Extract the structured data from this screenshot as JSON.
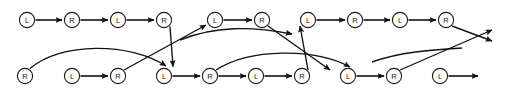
{
  "diagram": {
    "type": "directed-graph",
    "width": 506,
    "height": 95,
    "background_color": "#ffffff",
    "node_stroke_color": "#1a1a1a",
    "node_fill_color": "#ffffff",
    "edge_color": "#111111",
    "node_radius": 7.5,
    "rows": [
      {
        "name": "top-row",
        "y": 20,
        "nodes": [
          {
            "id": "t1",
            "label": "L",
            "x": 27
          },
          {
            "id": "t2",
            "label": "R",
            "x": 72
          },
          {
            "id": "t3",
            "label": "L",
            "x": 118
          },
          {
            "id": "t4",
            "label": "R",
            "x": 164
          },
          {
            "id": "t5",
            "label": "L",
            "x": 215
          },
          {
            "id": "t6",
            "label": "R",
            "x": 262
          },
          {
            "id": "t7",
            "label": "L",
            "x": 308
          },
          {
            "id": "t8",
            "label": "R",
            "x": 355
          },
          {
            "id": "t9",
            "label": "L",
            "x": 400
          },
          {
            "id": "t10",
            "label": "R",
            "x": 446
          }
        ]
      },
      {
        "name": "bottom-row",
        "y": 76,
        "nodes": [
          {
            "id": "b1",
            "label": "R",
            "x": 25
          },
          {
            "id": "b2",
            "label": "L",
            "x": 72
          },
          {
            "id": "b3",
            "label": "R",
            "x": 118
          },
          {
            "id": "b4",
            "label": "L",
            "x": 164
          },
          {
            "id": "b5",
            "label": "R",
            "x": 210
          },
          {
            "id": "b6",
            "label": "L",
            "x": 256
          },
          {
            "id": "b7",
            "label": "R",
            "x": 302
          },
          {
            "id": "b8",
            "label": "L",
            "x": 348
          },
          {
            "id": "b9",
            "label": "R",
            "x": 394
          },
          {
            "id": "b10",
            "label": "L",
            "x": 440
          }
        ]
      }
    ],
    "edges": [
      {
        "id": "e1",
        "kind": "straight-horizontal",
        "from": "t1",
        "to": "t2",
        "arrow": true
      },
      {
        "id": "e2",
        "kind": "straight-horizontal",
        "from": "t2",
        "to": "t3",
        "arrow": true
      },
      {
        "id": "e3",
        "kind": "straight-horizontal",
        "from": "t3",
        "to": "t4",
        "arrow": true
      },
      {
        "id": "e4",
        "kind": "diagonal-down",
        "from": "t4",
        "to": "b4",
        "arrow": true
      },
      {
        "id": "e5",
        "kind": "diagonal-up",
        "from": "b3",
        "to": "t5",
        "arrow": true
      },
      {
        "id": "e6",
        "kind": "straight-horizontal",
        "from": "t5",
        "to": "t6",
        "arrow": true
      },
      {
        "id": "e7",
        "kind": "diagonal-down",
        "from": "t6",
        "to": "b7",
        "arrow": true
      },
      {
        "id": "e8",
        "kind": "diagonal-up",
        "from": "b6",
        "to": "t7",
        "arrow": true
      },
      {
        "id": "e9",
        "kind": "straight-horizontal",
        "from": "t7",
        "to": "t8",
        "arrow": true
      },
      {
        "id": "e10",
        "kind": "straight-horizontal",
        "from": "t8",
        "to": "t9",
        "arrow": true
      },
      {
        "id": "e11",
        "kind": "straight-horizontal",
        "from": "t9",
        "to": "t10",
        "arrow": true
      },
      {
        "id": "e12",
        "kind": "diagonal-down-exit",
        "from": "t10",
        "to": "exit-right-lower",
        "arrow": true
      },
      {
        "id": "e13",
        "kind": "straight-horizontal",
        "from": "b2",
        "to": "b3",
        "arrow": true
      },
      {
        "id": "e14",
        "kind": "straight-horizontal",
        "from": "b4",
        "to": "b5",
        "arrow": true
      },
      {
        "id": "e15",
        "kind": "straight-horizontal",
        "from": "b5",
        "to": "b6",
        "arrow": true
      },
      {
        "id": "e16",
        "kind": "straight-horizontal",
        "from": "b6",
        "to": "b7",
        "arrow": true
      },
      {
        "id": "e17",
        "kind": "straight-horizontal",
        "from": "b8",
        "to": "b9",
        "arrow": true
      },
      {
        "id": "e18",
        "kind": "straight-horizontal",
        "from": "b10",
        "to": "exit-right",
        "arrow": true
      },
      {
        "id": "e19",
        "kind": "curve-up-over",
        "from": "b1",
        "to": "b4",
        "arrow": true
      },
      {
        "id": "e20",
        "kind": "curve-up-over",
        "from": "b5",
        "to": "b8",
        "arrow": true
      },
      {
        "id": "e21",
        "kind": "curve-up-over",
        "from": "b9",
        "to": "exit-right-upper",
        "arrow": true
      },
      {
        "id": "e22",
        "kind": "diagonal-up",
        "from": "b7",
        "to": "b8-alt",
        "arrow": true
      },
      {
        "id": "e23",
        "kind": "diagonal-up",
        "from": "b9",
        "to": "b10-alt",
        "arrow": true
      }
    ],
    "labels": {
      "left": "L",
      "right": "R"
    }
  }
}
